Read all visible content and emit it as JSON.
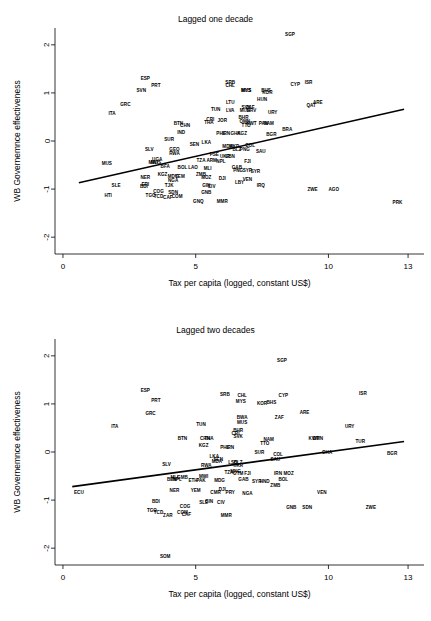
{
  "figure": {
    "panels": [
      {
        "title": "Lagged one decade",
        "xlabel": "Tax per capita (logged, constant US$)",
        "ylabel": "WB Governemnce effectiveness"
      },
      {
        "title": "Lagged two decades",
        "xlabel": "Tax per capita (logged, constant US$)",
        "ylabel": "WB Governemnce effectiveness"
      }
    ]
  },
  "chart_data": [
    {
      "type": "scatter",
      "title": "Lagged one decade",
      "xlabel": "Tax per capita (logged, constant US$)",
      "ylabel": "WB Governemnce effectiveness",
      "xlim": [
        -0.3,
        13.6
      ],
      "ylim": [
        -2.35,
        2.35
      ],
      "xticks": [
        0,
        5,
        10,
        13
      ],
      "yticks": [
        -2,
        -1,
        0,
        1,
        2
      ],
      "grid": false,
      "legend": "none",
      "marker": "text-label",
      "fit_line": {
        "x": [
          0.6,
          12.85
        ],
        "y": [
          -0.87,
          0.66
        ]
      },
      "points": [
        {
          "label": "SGP",
          "x": 8.55,
          "y": 2.22
        },
        {
          "label": "ISR",
          "x": 9.25,
          "y": 1.22
        },
        {
          "label": "CYP",
          "x": 8.75,
          "y": 1.18
        },
        {
          "label": "ESP",
          "x": 3.1,
          "y": 1.3
        },
        {
          "label": "PRT",
          "x": 3.5,
          "y": 1.15
        },
        {
          "label": "SVN",
          "x": 2.95,
          "y": 1.05
        },
        {
          "label": "SRB",
          "x": 6.3,
          "y": 1.22
        },
        {
          "label": "CHL",
          "x": 6.3,
          "y": 1.16
        },
        {
          "label": "MYS",
          "x": 6.9,
          "y": 1.04
        },
        {
          "label": "MUS",
          "x": 6.9,
          "y": 1.04
        },
        {
          "label": "BHS",
          "x": 7.65,
          "y": 1.05
        },
        {
          "label": "KOR",
          "x": 7.7,
          "y": 1.0
        },
        {
          "label": "HUN",
          "x": 7.5,
          "y": 0.87
        },
        {
          "label": "GRC",
          "x": 2.35,
          "y": 0.76
        },
        {
          "label": "LTU",
          "x": 6.3,
          "y": 0.81
        },
        {
          "label": "ARE",
          "x": 9.6,
          "y": 0.8
        },
        {
          "label": "QAT",
          "x": 9.35,
          "y": 0.74
        },
        {
          "label": "ITA",
          "x": 1.85,
          "y": 0.58
        },
        {
          "label": "TUN",
          "x": 5.75,
          "y": 0.65
        },
        {
          "label": "LVA",
          "x": 6.3,
          "y": 0.64
        },
        {
          "label": "SVK",
          "x": 6.9,
          "y": 0.7
        },
        {
          "label": "ZAF",
          "x": 7.05,
          "y": 0.7
        },
        {
          "label": "MUS",
          "x": 6.85,
          "y": 0.63
        },
        {
          "label": "HRV",
          "x": 7.1,
          "y": 0.63
        },
        {
          "label": "URY",
          "x": 7.9,
          "y": 0.6
        },
        {
          "label": "BHR",
          "x": 6.8,
          "y": 0.49
        },
        {
          "label": "CRI",
          "x": 5.55,
          "y": 0.45
        },
        {
          "label": "JOR",
          "x": 6.0,
          "y": 0.42
        },
        {
          "label": "OMN",
          "x": 6.85,
          "y": 0.4
        },
        {
          "label": "THA",
          "x": 5.5,
          "y": 0.38
        },
        {
          "label": "BTN",
          "x": 4.35,
          "y": 0.36
        },
        {
          "label": "CHN",
          "x": 4.6,
          "y": 0.32
        },
        {
          "label": "TTO",
          "x": 6.9,
          "y": 0.32
        },
        {
          "label": "KWT",
          "x": 7.1,
          "y": 0.36
        },
        {
          "label": "PAN",
          "x": 7.55,
          "y": 0.36
        },
        {
          "label": "NAM",
          "x": 7.75,
          "y": 0.36
        },
        {
          "label": "BRA",
          "x": 8.45,
          "y": 0.23
        },
        {
          "label": "BGR",
          "x": 7.85,
          "y": 0.14
        },
        {
          "label": "IND",
          "x": 4.45,
          "y": 0.18
        },
        {
          "label": "PHL",
          "x": 5.95,
          "y": 0.15
        },
        {
          "label": "IRN",
          "x": 6.15,
          "y": 0.15
        },
        {
          "label": "GHA",
          "x": 6.5,
          "y": 0.15
        },
        {
          "label": "KGZ",
          "x": 6.75,
          "y": 0.15
        },
        {
          "label": "SUR",
          "x": 4.0,
          "y": 0.03
        },
        {
          "label": "LKA",
          "x": 5.4,
          "y": -0.04
        },
        {
          "label": "SEN",
          "x": 4.95,
          "y": -0.08
        },
        {
          "label": "MDA",
          "x": 6.2,
          "y": -0.12
        },
        {
          "label": "MKD",
          "x": 6.45,
          "y": -0.12
        },
        {
          "label": "COL",
          "x": 7.05,
          "y": -0.09
        },
        {
          "label": "GEO",
          "x": 4.2,
          "y": -0.17
        },
        {
          "label": "SLV",
          "x": 3.25,
          "y": -0.18
        },
        {
          "label": "PNG",
          "x": 6.85,
          "y": -0.17
        },
        {
          "label": "BLZ",
          "x": 6.55,
          "y": -0.17
        },
        {
          "label": "SAU",
          "x": 7.45,
          "y": -0.22
        },
        {
          "label": "RWA",
          "x": 4.2,
          "y": -0.25
        },
        {
          "label": "PSE",
          "x": 5.7,
          "y": -0.28
        },
        {
          "label": "UGA",
          "x": 3.55,
          "y": -0.38
        },
        {
          "label": "MWI",
          "x": 3.4,
          "y": -0.45
        },
        {
          "label": "MUS",
          "x": 3.5,
          "y": -0.45
        },
        {
          "label": "TZA",
          "x": 5.2,
          "y": -0.4
        },
        {
          "label": "LBN",
          "x": 6.3,
          "y": -0.33
        },
        {
          "label": "UKR",
          "x": 6.1,
          "y": -0.33
        },
        {
          "label": "ARM",
          "x": 5.6,
          "y": -0.4
        },
        {
          "label": "NPL",
          "x": 5.95,
          "y": -0.42
        },
        {
          "label": "FJI",
          "x": 6.95,
          "y": -0.42
        },
        {
          "label": "MUS",
          "x": 1.65,
          "y": -0.47
        },
        {
          "label": "BFA",
          "x": 3.85,
          "y": -0.52
        },
        {
          "label": "BOL",
          "x": 4.5,
          "y": -0.55
        },
        {
          "label": "LAO",
          "x": 4.9,
          "y": -0.55
        },
        {
          "label": "MLI",
          "x": 5.45,
          "y": -0.57
        },
        {
          "label": "GAB",
          "x": 6.55,
          "y": -0.55
        },
        {
          "label": "PNG",
          "x": 6.6,
          "y": -0.62
        },
        {
          "label": "SYR",
          "x": 6.95,
          "y": -0.62
        },
        {
          "label": "SYR",
          "x": 7.25,
          "y": -0.63
        },
        {
          "label": "KGZ",
          "x": 3.75,
          "y": -0.7
        },
        {
          "label": "MDG",
          "x": 4.15,
          "y": -0.73
        },
        {
          "label": "YEM",
          "x": 4.4,
          "y": -0.73
        },
        {
          "label": "ZMB",
          "x": 5.2,
          "y": -0.7
        },
        {
          "label": "MOZ",
          "x": 5.4,
          "y": -0.76
        },
        {
          "label": "NER",
          "x": 3.1,
          "y": -0.75
        },
        {
          "label": "DJI",
          "x": 6.0,
          "y": -0.77
        },
        {
          "label": "VEN",
          "x": 6.95,
          "y": -0.8
        },
        {
          "label": "NGA",
          "x": 4.15,
          "y": -0.82
        },
        {
          "label": "LBY",
          "x": 6.65,
          "y": -0.87
        },
        {
          "label": "SLE",
          "x": 2.0,
          "y": -0.93
        },
        {
          "label": "ERI",
          "x": 3.1,
          "y": -0.9
        },
        {
          "label": "BDI",
          "x": 3.05,
          "y": -0.94
        },
        {
          "label": "TJK",
          "x": 4.0,
          "y": -0.92
        },
        {
          "label": "GIN",
          "x": 5.4,
          "y": -0.92
        },
        {
          "label": "CIV",
          "x": 5.6,
          "y": -0.94
        },
        {
          "label": "IRQ",
          "x": 7.45,
          "y": -0.93
        },
        {
          "label": "ZWE",
          "x": 9.4,
          "y": -1.0
        },
        {
          "label": "AGO",
          "x": 10.2,
          "y": -1.0
        },
        {
          "label": "COG",
          "x": 3.6,
          "y": -1.05
        },
        {
          "label": "SDN",
          "x": 4.15,
          "y": -1.07
        },
        {
          "label": "GNB",
          "x": 5.4,
          "y": -1.07
        },
        {
          "label": "TGO",
          "x": 3.3,
          "y": -1.14
        },
        {
          "label": "TCD",
          "x": 3.6,
          "y": -1.15
        },
        {
          "label": "CAF",
          "x": 3.95,
          "y": -1.18
        },
        {
          "label": "COM",
          "x": 4.3,
          "y": -1.15
        },
        {
          "label": "HTI",
          "x": 1.7,
          "y": -1.14
        },
        {
          "label": "GNQ",
          "x": 5.1,
          "y": -1.25
        },
        {
          "label": "MMR",
          "x": 6.0,
          "y": -1.25
        },
        {
          "label": "PRK",
          "x": 12.6,
          "y": -1.28
        }
      ]
    },
    {
      "type": "scatter",
      "title": "Lagged two decades",
      "xlabel": "Tax per capita (logged, constant US$)",
      "ylabel": "WB Governemnce effectiveness",
      "xlim": [
        -0.3,
        13.6
      ],
      "ylim": [
        -2.35,
        2.35
      ],
      "xticks": [
        0,
        5,
        10,
        13
      ],
      "yticks": [
        -2,
        -1,
        0,
        1,
        2
      ],
      "grid": false,
      "legend": "none",
      "marker": "text-label",
      "fit_line": {
        "x": [
          0.35,
          12.85
        ],
        "y": [
          -0.72,
          0.22
        ]
      },
      "points": [
        {
          "label": "SGP",
          "x": 8.25,
          "y": 1.9
        },
        {
          "label": "ISR",
          "x": 11.3,
          "y": 1.22
        },
        {
          "label": "ESP",
          "x": 3.1,
          "y": 1.28
        },
        {
          "label": "SRB",
          "x": 6.1,
          "y": 1.2
        },
        {
          "label": "CHL",
          "x": 6.75,
          "y": 1.17
        },
        {
          "label": "CYP",
          "x": 8.3,
          "y": 1.18
        },
        {
          "label": "PRT",
          "x": 3.5,
          "y": 1.07
        },
        {
          "label": "MYS",
          "x": 6.7,
          "y": 1.04
        },
        {
          "label": "KOR",
          "x": 7.5,
          "y": 1.0
        },
        {
          "label": "BHS",
          "x": 7.85,
          "y": 1.03
        },
        {
          "label": "GRC",
          "x": 3.3,
          "y": 0.8
        },
        {
          "label": "ARE",
          "x": 9.1,
          "y": 0.82
        },
        {
          "label": "BWA",
          "x": 6.75,
          "y": 0.72
        },
        {
          "label": "ZAF",
          "x": 8.15,
          "y": 0.72
        },
        {
          "label": "MUS",
          "x": 6.75,
          "y": 0.62
        },
        {
          "label": "TUN",
          "x": 5.2,
          "y": 0.58
        },
        {
          "label": "ITA",
          "x": 1.95,
          "y": 0.52
        },
        {
          "label": "URY",
          "x": 10.8,
          "y": 0.53
        },
        {
          "label": "BHR",
          "x": 6.6,
          "y": 0.44
        },
        {
          "label": "CRI",
          "x": 6.5,
          "y": 0.38
        },
        {
          "label": "SVK",
          "x": 6.6,
          "y": 0.33
        },
        {
          "label": "BTN",
          "x": 4.5,
          "y": 0.28
        },
        {
          "label": "CHN",
          "x": 5.35,
          "y": 0.28
        },
        {
          "label": "THA",
          "x": 5.5,
          "y": 0.28
        },
        {
          "label": "NAM",
          "x": 7.75,
          "y": 0.26
        },
        {
          "label": "KWT",
          "x": 9.45,
          "y": 0.28
        },
        {
          "label": "OMN",
          "x": 9.6,
          "y": 0.28
        },
        {
          "label": "TUR",
          "x": 11.2,
          "y": 0.22
        },
        {
          "label": "TTO",
          "x": 7.6,
          "y": 0.18
        },
        {
          "label": "KGZ",
          "x": 5.3,
          "y": 0.13
        },
        {
          "label": "PHL",
          "x": 6.1,
          "y": 0.1
        },
        {
          "label": "IRN",
          "x": 6.3,
          "y": 0.1
        },
        {
          "label": "SUR",
          "x": 7.4,
          "y": 0.0
        },
        {
          "label": "GHA",
          "x": 9.95,
          "y": 0.0
        },
        {
          "label": "BGR",
          "x": 12.4,
          "y": -0.04
        },
        {
          "label": "COL",
          "x": 8.1,
          "y": -0.05
        },
        {
          "label": "LKA",
          "x": 5.7,
          "y": -0.1
        },
        {
          "label": "SEN",
          "x": 5.85,
          "y": -0.15
        },
        {
          "label": "SAU",
          "x": 8.0,
          "y": -0.16
        },
        {
          "label": "MDA",
          "x": 5.8,
          "y": -0.2
        },
        {
          "label": "LSO",
          "x": 6.4,
          "y": -0.22
        },
        {
          "label": "BLZ",
          "x": 6.6,
          "y": -0.22
        },
        {
          "label": "SLV",
          "x": 3.9,
          "y": -0.27
        },
        {
          "label": "RWA",
          "x": 5.4,
          "y": -0.28
        },
        {
          "label": "UKR",
          "x": 6.6,
          "y": -0.29
        },
        {
          "label": "TZA",
          "x": 6.25,
          "y": -0.43
        },
        {
          "label": "MNG",
          "x": 6.5,
          "y": -0.4
        },
        {
          "label": "GTM",
          "x": 6.6,
          "y": -0.45
        },
        {
          "label": "FJI",
          "x": 6.95,
          "y": -0.45
        },
        {
          "label": "IRN",
          "x": 8.1,
          "y": -0.45
        },
        {
          "label": "MOZ",
          "x": 8.5,
          "y": -0.45
        },
        {
          "label": "MWI",
          "x": 5.3,
          "y": -0.5
        },
        {
          "label": "MLI",
          "x": 4.2,
          "y": -0.52
        },
        {
          "label": "GMB",
          "x": 4.5,
          "y": -0.52
        },
        {
          "label": "BEN",
          "x": 4.1,
          "y": -0.57
        },
        {
          "label": "NPL",
          "x": 4.3,
          "y": -0.58
        },
        {
          "label": "ETH",
          "x": 4.9,
          "y": -0.6
        },
        {
          "label": "PAK",
          "x": 5.2,
          "y": -0.6
        },
        {
          "label": "MDG",
          "x": 5.9,
          "y": -0.6
        },
        {
          "label": "GAB",
          "x": 6.8,
          "y": -0.58
        },
        {
          "label": "BOL",
          "x": 8.3,
          "y": -0.58
        },
        {
          "label": "SYR",
          "x": 7.3,
          "y": -0.62
        },
        {
          "label": "HND",
          "x": 7.6,
          "y": -0.62
        },
        {
          "label": "ZMB",
          "x": 8.0,
          "y": -0.7
        },
        {
          "label": "ECU",
          "x": 0.6,
          "y": -0.85
        },
        {
          "label": "NER",
          "x": 4.2,
          "y": -0.8
        },
        {
          "label": "YEM",
          "x": 5.0,
          "y": -0.8
        },
        {
          "label": "CMR",
          "x": 5.75,
          "y": -0.84
        },
        {
          "label": "DJI",
          "x": 6.0,
          "y": -0.78
        },
        {
          "label": "PRY",
          "x": 6.3,
          "y": -0.84
        },
        {
          "label": "NGA",
          "x": 6.95,
          "y": -0.86
        },
        {
          "label": "VEN",
          "x": 9.75,
          "y": -0.85
        },
        {
          "label": "BDI",
          "x": 3.5,
          "y": -1.02
        },
        {
          "label": "SLE",
          "x": 5.3,
          "y": -1.05
        },
        {
          "label": "GIN",
          "x": 5.5,
          "y": -1.02
        },
        {
          "label": "CIV",
          "x": 5.95,
          "y": -1.05
        },
        {
          "label": "COG",
          "x": 4.6,
          "y": -1.13
        },
        {
          "label": "GNB",
          "x": 8.6,
          "y": -1.15
        },
        {
          "label": "SDN",
          "x": 9.2,
          "y": -1.15
        },
        {
          "label": "ZWE",
          "x": 11.6,
          "y": -1.15
        },
        {
          "label": "TGO",
          "x": 3.35,
          "y": -1.22
        },
        {
          "label": "TCD",
          "x": 3.6,
          "y": -1.26
        },
        {
          "label": "COM",
          "x": 4.5,
          "y": -1.26
        },
        {
          "label": "CAF",
          "x": 4.65,
          "y": -1.3
        },
        {
          "label": "ZAR",
          "x": 3.95,
          "y": -1.33
        },
        {
          "label": "MMR",
          "x": 6.15,
          "y": -1.33
        },
        {
          "label": "SOM",
          "x": 3.85,
          "y": -2.18
        }
      ]
    }
  ]
}
